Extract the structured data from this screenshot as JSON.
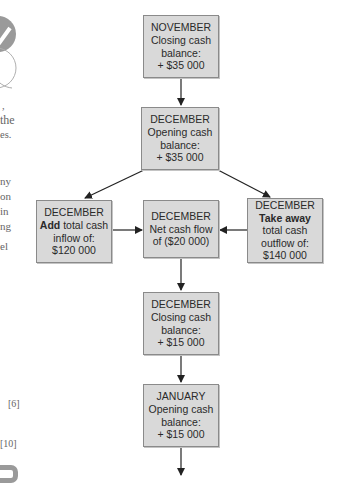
{
  "margin_fragments": {
    "line1": ",",
    "line2": "the",
    "line3": "es.",
    "line4": "ny",
    "line5": "on",
    "line6": "in",
    "line7": "ng",
    "line8": "el",
    "mark1": "[6]",
    "mark2": "[10]"
  },
  "diagram": {
    "nodes": {
      "nov_closing": {
        "lines": [
          "NOVEMBER",
          "Closing cash",
          "balance:",
          "+ $35 000"
        ]
      },
      "dec_opening": {
        "lines": [
          "DECEMBER",
          "Opening cash",
          "balance:",
          "+ $35 000"
        ]
      },
      "dec_inflow": {
        "line1": "DECEMBER",
        "bold": "Add",
        "line2_rest": " total cash",
        "line3": "inflow of:",
        "line4": "$120 000"
      },
      "dec_net": {
        "lines": [
          "DECEMBER",
          "Net cash flow",
          "of ($20 000)"
        ]
      },
      "dec_outflow": {
        "line1": "DECEMBER",
        "bold": "Take away",
        "line3": "total cash",
        "line4": "outflow of:",
        "line5": "$140 000"
      },
      "dec_closing": {
        "lines": [
          "DECEMBER",
          "Closing cash",
          "balance:",
          "+ $15 000"
        ]
      },
      "jan_opening": {
        "lines": [
          "JANUARY",
          "Opening cash",
          "balance:",
          "+ $15 000"
        ]
      }
    },
    "edges": [
      {
        "from": "nov_closing",
        "to": "dec_opening"
      },
      {
        "from": "dec_opening",
        "to": "dec_inflow"
      },
      {
        "from": "dec_opening",
        "to": "dec_outflow"
      },
      {
        "from": "dec_inflow",
        "to": "dec_net"
      },
      {
        "from": "dec_outflow",
        "to": "dec_net"
      },
      {
        "from": "dec_net",
        "to": "dec_closing"
      },
      {
        "from": "dec_closing",
        "to": "jan_opening"
      },
      {
        "from": "jan_opening",
        "to": "continuation"
      }
    ],
    "colors": {
      "box_fill": "#d9d9d9",
      "box_border": "#8a8a8a",
      "arrow": "#222222"
    }
  }
}
